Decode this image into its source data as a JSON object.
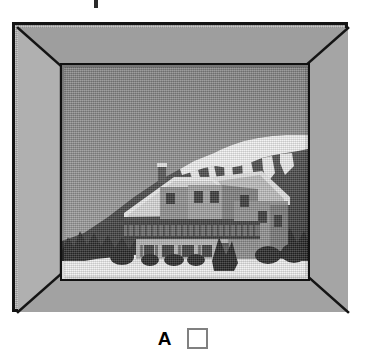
{
  "page": {
    "background_color": "#ffffff",
    "width": 366,
    "height": 355,
    "clipped_text_fragment": ""
  },
  "frame": {
    "name": "picture-frame",
    "style": "bevelled mitred moulding",
    "face_color": "#a8a8a8",
    "outline_color": "#141414",
    "bevel_line_color": "#141414",
    "top_band_color": "#9e9e9e",
    "bottom_band_color": "#a2a2a2",
    "left_band_color": "#b0b0b0",
    "right_band_color": "#a5a5a5"
  },
  "photo": {
    "name": "alpine-chalet-photograph",
    "description": "Black and white photograph of an alpine chalet in snow with a snow-capped mountain ridge behind",
    "border_color": "#101010",
    "sky_color_top": "#8a8a8a",
    "sky_color_bottom": "#9d9d9d",
    "mountain_color": "#4a4a4a",
    "mountain_shadow_color": "#3a3a3a",
    "snow_color": "#f4f4f4",
    "snow_field_color": "#ededed",
    "tree_color": "#2e2e2e",
    "house_wall_color": "#9a9a9a",
    "house_wall_shadow_color": "#6f6f6f",
    "house_roof_color": "#5a5a5a",
    "balcony_color": "#5f5f5f",
    "window_color": "#3c3c3c",
    "elements": [
      "sky",
      "snow-capped mountain ridge",
      "snow patches on ridge",
      "dark forested slope",
      "chalet with gabled snow-covered roof",
      "chimney",
      "wooden balcony railing",
      "ground floor windows and door",
      "shrubs and conifers",
      "snow-covered foreground"
    ]
  },
  "answer": {
    "option_letter": "A",
    "checkbox_checked": false,
    "checkbox_border_color": "#808080",
    "checkbox_fill_color": "#ffffff"
  }
}
